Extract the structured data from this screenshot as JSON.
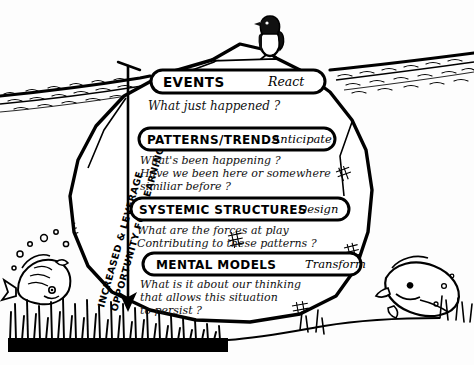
{
  "figure": {
    "name": "iceberg-model",
    "style": "hand-drawn black ink sketch on white paper",
    "colors": {
      "ink": "#000000",
      "paper": "#ffffff",
      "water": "#1a1a1a"
    }
  },
  "scene": {
    "waterline_label": "ocean surface waterline with wave hatching",
    "penguin_label": "penguin standing on the iceberg tip",
    "fish_left_label": "fish with bubbles at lower left",
    "fish_right_label": "fish at lower right",
    "seabed_label": "dense sea grass along the seabed",
    "arrow_label": "downward arrow along the left of the iceberg"
  },
  "vertical_axis": {
    "line1": "INCREASED & LEVERAGE",
    "line2": "OPPORTUNITY FOR LEARNING"
  },
  "levels": [
    {
      "id": "events",
      "title": "EVENTS",
      "action": "React",
      "questions": [
        "What just happened ?"
      ]
    },
    {
      "id": "patterns-trends",
      "title": "PATTERNS/TRENDS",
      "action": "Anticipate",
      "questions": [
        "What's been happening ?",
        "Have we been here or somewhere",
        "similiar before ?"
      ]
    },
    {
      "id": "systemic-structures",
      "title": "SYSTEMIC STRUCTURES",
      "action": "Design",
      "questions": [
        "What are the forces at play",
        "Contributing to these patterns ?"
      ]
    },
    {
      "id": "mental-models",
      "title": "MENTAL MODELS",
      "action": "Transform",
      "questions": [
        "What is it about our thinking",
        "that allows this situation",
        "to persist ?"
      ]
    }
  ]
}
